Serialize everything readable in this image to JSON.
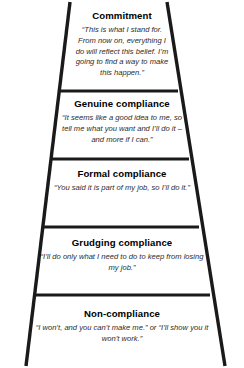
{
  "diagram": {
    "type": "ladder-of-commitment",
    "shape": "trapezoid-ladder",
    "line_color": "#1a1a1a",
    "background_color": "#ffffff",
    "title_color": "#000000",
    "quote_color": "#2b2b2b",
    "levels": [
      {
        "id": "commitment",
        "title": "Commitment",
        "quote": "“This is what I stand for. From now on, everything I do will reflect this belief. I’m going to find a way to make this happen.”"
      },
      {
        "id": "genuine-compliance",
        "title": "Genuine compliance",
        "quote": "“It seems like a good idea to me, so tell me what you want and I’ll do it – and more if I can.”"
      },
      {
        "id": "formal-compliance",
        "title": "Formal compliance",
        "quote": "“You said it is part of my job, so I’ll do it.”"
      },
      {
        "id": "grudging-compliance",
        "title": "Grudging compliance",
        "quote": "“I’ll do only what I need to do to keep from losing my job.”"
      },
      {
        "id": "non-compliance",
        "title": "Non-compliance",
        "quote": "“I won’t, and you can’t make me.” or “I’ll show you it won’t work.”"
      }
    ]
  }
}
